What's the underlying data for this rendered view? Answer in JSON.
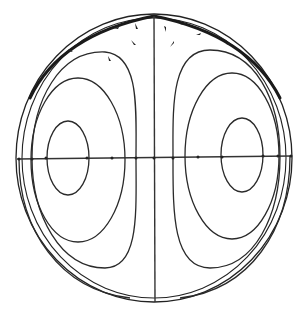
{
  "figure": {
    "colors": {
      "background": "#ffffff",
      "line": "#2a2a2a"
    },
    "boundary": {
      "cx": 154,
      "cy": 158,
      "rx": 138,
      "ry": 144
    },
    "axes": {
      "horizontal_y": 158,
      "vertical_x": 154
    },
    "left_cell": {
      "contours": [
        {
          "cx": 83,
          "cy": 158,
          "rx": 30,
          "ry": 48
        },
        {
          "cx": 78,
          "cy": 160,
          "rx": 55,
          "ry": 92
        },
        {
          "cx": 72,
          "cy": 158,
          "rx": 80,
          "ry": 118
        }
      ]
    },
    "right_cell": {
      "contours": [
        {
          "cx": 226,
          "cy": 158,
          "rx": 30,
          "ry": 48
        },
        {
          "cx": 231,
          "cy": 160,
          "rx": 55,
          "ry": 92
        },
        {
          "cx": 237,
          "cy": 158,
          "rx": 80,
          "ry": 118
        }
      ]
    },
    "labels": []
  }
}
